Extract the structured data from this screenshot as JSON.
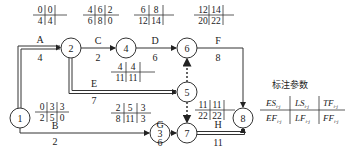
{
  "nodes": [
    {
      "id": "1",
      "x": 20,
      "y": 118
    },
    {
      "id": "2",
      "x": 71,
      "y": 48
    },
    {
      "id": "3",
      "x": 160,
      "y": 133
    },
    {
      "id": "4",
      "x": 126,
      "y": 48
    },
    {
      "id": "5",
      "x": 187,
      "y": 92
    },
    {
      "id": "6",
      "x": 187,
      "y": 48
    },
    {
      "id": "7",
      "x": 187,
      "y": 133
    },
    {
      "id": "8",
      "x": 243,
      "y": 118
    }
  ],
  "activities": [
    {
      "name": "A",
      "duration": "4",
      "from": "1",
      "to": "2",
      "critical": true,
      "params": {
        "ES": "0",
        "LS": "0",
        "TF": "",
        "EF": "4",
        "LF": "4",
        "FF": ""
      }
    },
    {
      "name": "B",
      "duration": "2",
      "from": "1",
      "to": "3",
      "critical": false,
      "params": {
        "ES": "0",
        "LS": "3",
        "TF": "3",
        "EF": "2",
        "LF": "5",
        "FF": "0"
      }
    },
    {
      "name": "C",
      "duration": "2",
      "from": "2",
      "to": "4",
      "critical": false,
      "params": {
        "ES": "4",
        "LS": "6",
        "TF": "2",
        "EF": "6",
        "LF": "8",
        "FF": "0"
      }
    },
    {
      "name": "D",
      "duration": "6",
      "from": "4",
      "to": "6",
      "critical": false,
      "params": {
        "ES": "6",
        "LS": "8",
        "TF": "",
        "EF": "12",
        "LF": "14",
        "FF": ""
      }
    },
    {
      "name": "E",
      "duration": "7",
      "from": "2",
      "to": "5",
      "critical": true,
      "params": {
        "ES": "4",
        "LS": "4",
        "TF": "",
        "EF": "11",
        "LF": "11",
        "FF": ""
      }
    },
    {
      "name": "F",
      "duration": "8",
      "from": "6",
      "to": "8",
      "critical": false,
      "params": {
        "ES": "12",
        "LS": "14",
        "TF": "",
        "EF": "20",
        "LF": "22",
        "FF": ""
      }
    },
    {
      "name": "G",
      "duration": "6",
      "from": "3",
      "to": "7",
      "critical": false,
      "params": {
        "ES": "2",
        "LS": "5",
        "TF": "3",
        "EF": "8",
        "LF": "11",
        "FF": "3"
      }
    },
    {
      "name": "H",
      "duration": "11",
      "from": "7",
      "to": "8",
      "critical": true,
      "params": {
        "ES": "11",
        "LS": "11",
        "TF": "",
        "EF": "22",
        "LF": "22",
        "FF": ""
      }
    }
  ],
  "dummies": [
    {
      "from": "5",
      "to": "6"
    },
    {
      "from": "5",
      "to": "7"
    }
  ],
  "legend": {
    "title": "标注参数",
    "top": [
      "ES",
      "LS",
      "TF"
    ],
    "bottom": [
      "EF",
      "LF",
      "FF"
    ],
    "subscript": "i-j"
  }
}
